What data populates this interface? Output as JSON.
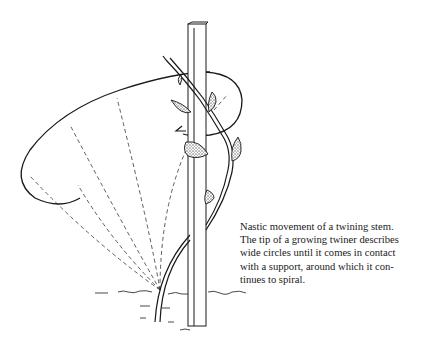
{
  "figure": {
    "colors": {
      "ink": "#1a1a1a",
      "background": "#ffffff",
      "leaf_fill": "#bdbdbd"
    }
  },
  "caption": {
    "lines": [
      "Nastic movement of a twining stem.",
      "The tip of a growing twiner describes",
      "wide circles until it comes in contact",
      "with a support, around which it con-",
      "tinues to spiral."
    ]
  }
}
